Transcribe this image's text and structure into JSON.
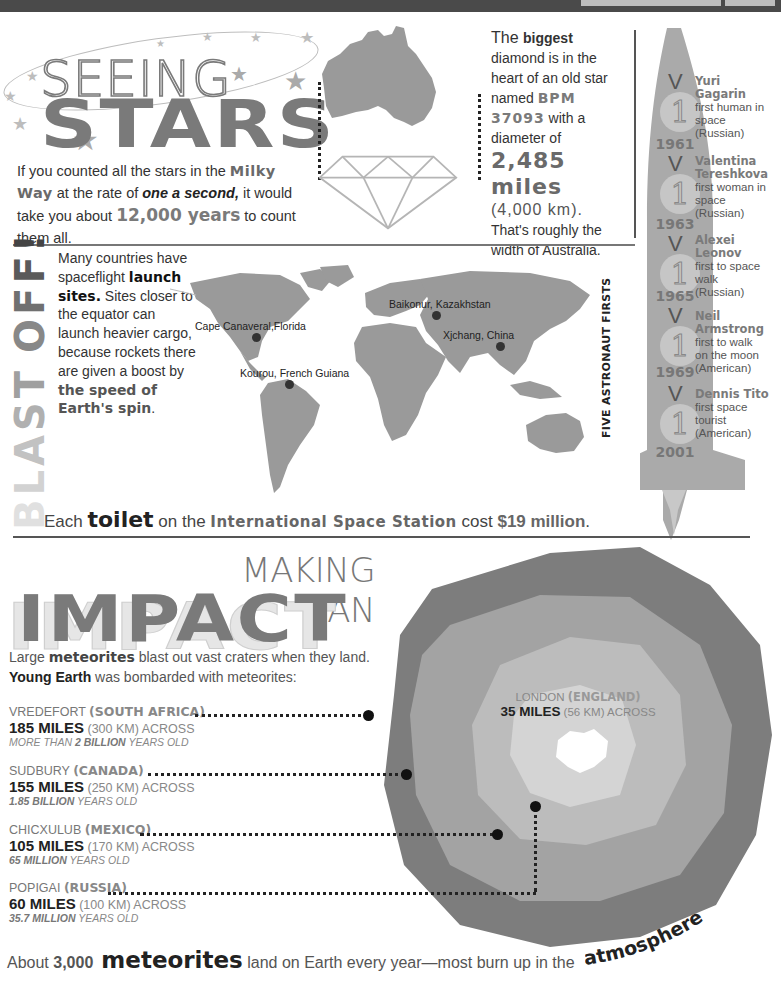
{
  "colors": {
    "dark_bar": "#4a4a4a",
    "gray_heading": "#7a7a7a",
    "map_fill": "#9a9a9a",
    "crater_outer": "#7d7d7d",
    "crater_ring2": "#a3a3a3",
    "crater_ring3": "#bcbcbc",
    "crater_inner": "#d4d4d4"
  },
  "seeing_stars": {
    "title_line1": "SEEING",
    "title_line2": "STARS",
    "text": {
      "p1": "If you counted all the stars in the ",
      "milky_way": "Milky Way",
      "p2": " at the rate of ",
      "one_a_second": "one a second,",
      "p3": " it would take you about ",
      "years": "12,000 years",
      "p4": " to count them all."
    }
  },
  "diamond": {
    "the": "The ",
    "biggest": "biggest",
    "line2": " diamond is in the heart of an old star named ",
    "star_name": "BPM 37093",
    "line3": " with a diameter of ",
    "diameter": "2,485 miles",
    "km": "(4,000 km).",
    "line4": " That's roughly the width of Australia."
  },
  "astronauts": {
    "title": "FIVE ASTRONAUT FIRSTS",
    "items": [
      {
        "year": "1961",
        "name": "Yuri Gagarin",
        "desc": "first human in space (Russian)"
      },
      {
        "year": "1963",
        "name": "Valentina Tereshkova",
        "desc": "first woman in space (Russian)"
      },
      {
        "year": "1965",
        "name": "Alexei Leonov",
        "desc": "first to space walk (Russian)"
      },
      {
        "year": "1969",
        "name": "Neil Armstrong",
        "desc": "first to walk on the moon (American)"
      },
      {
        "year": "2001",
        "name": "Dennis Tito",
        "desc": "first space tourist (American)"
      }
    ],
    "medal_number": "1"
  },
  "blast_off": {
    "title_letters": [
      "B",
      "L",
      "A",
      "S",
      "T",
      " ",
      "O",
      "F",
      "F",
      "!"
    ],
    "text": {
      "p1": "Many countries have spaceflight ",
      "launch_sites": "launch sites.",
      "p2": " Sites closer to the equator can launch heavier cargo, because rockets there are given a boost by ",
      "speed": "the speed of Earth's spin",
      "p3": "."
    },
    "sites": [
      {
        "label": "Cape Canaveral,Florida"
      },
      {
        "label": "Kourou, French Guiana"
      },
      {
        "label": "Baikonur, Kazakhstan"
      },
      {
        "label": "Xjchang, China"
      }
    ]
  },
  "toilet": {
    "each": "Each ",
    "toilet": "toilet",
    "on_the": " on the ",
    "iss": "International Space Station",
    "cost": " cost ",
    "amount": "$19 million",
    "end": "."
  },
  "impact": {
    "title_line1": "MAKING AN",
    "title_line2": "IMPACT",
    "intro": {
      "p1": "Large ",
      "meteorites": "meteorites",
      "p2": " blast out vast craters when they land.",
      "young_earth": "Young Earth",
      "p3": " was bombarded with meteorites:"
    },
    "craters": [
      {
        "name": "VREDEFORT ",
        "country": "(SOUTH AFRICA)",
        "miles": "185 MILES",
        "rest": " (300 KM) ACROSS",
        "age_pre": "MORE THAN ",
        "age_bold": "2 BILLION",
        "age_post": " YEARS OLD"
      },
      {
        "name": "SUDBURY ",
        "country": "(CANADA)",
        "miles": "155 MILES",
        "rest": " (250 KM) ACROSS",
        "age_pre": "",
        "age_bold": "1.85 BILLION",
        "age_post": " YEARS OLD"
      },
      {
        "name": "CHICXULUB ",
        "country": "(MEXICO)",
        "miles": "105 MILES",
        "rest": " (170 KM) ACROSS",
        "age_pre": "",
        "age_bold": "65 MILLION",
        "age_post": " YEARS OLD"
      },
      {
        "name": "POPIGAI ",
        "country": "(RUSSIA)",
        "miles": "60 MILES",
        "rest": " (100 KM) ACROSS",
        "age_pre": "",
        "age_bold": "35.7 MILLION",
        "age_post": " YEARS OLD"
      }
    ],
    "london": {
      "name": "LONDON ",
      "country": "(ENGLAND)",
      "miles": "35 MILES",
      "rest": " (56 KM) ACROSS"
    }
  },
  "footer": {
    "about": "About ",
    "number": "3,000",
    "meteorites": " meteorites",
    "rest": " land on Earth every year—most burn up in the ",
    "atmosphere": "atmosphere",
    "end": "."
  }
}
